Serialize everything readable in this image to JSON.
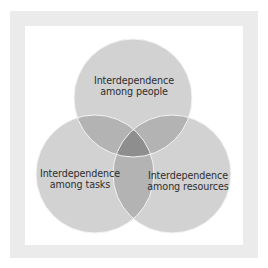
{
  "diagram": {
    "type": "venn",
    "frame": {
      "border_color": "#ebebeb",
      "background": "#ffffff"
    },
    "colors": {
      "single": "#d2d2d2",
      "pair": "#b3b3b3",
      "triple": "#8e8e8e",
      "outline": "#f4f4f4",
      "text": "#2e2e2e"
    },
    "circles": [
      {
        "id": "people",
        "line1": "Interdependence",
        "line2": "among people",
        "cx": 133,
        "cy": 98,
        "r": 59
      },
      {
        "id": "tasks",
        "line1": "Interdependence",
        "line2": "among tasks",
        "cx": 95,
        "cy": 174,
        "r": 59
      },
      {
        "id": "resources",
        "line1": "Interdependence",
        "line2": "among resources",
        "cx": 172,
        "cy": 174,
        "r": 59
      }
    ]
  }
}
